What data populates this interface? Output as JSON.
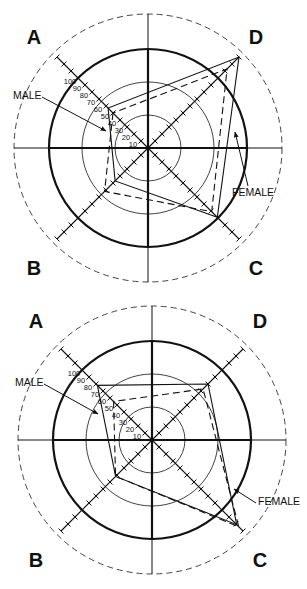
{
  "chart_data": [
    {
      "type": "radar",
      "title": "",
      "axes": [
        "A",
        "B",
        "C",
        "D"
      ],
      "scale": {
        "min": 0,
        "max": 130,
        "tick_step": 10,
        "tick_labels": [
          "10",
          "20",
          "30",
          "40",
          "50",
          "60",
          "70",
          "80",
          "90",
          "100"
        ],
        "reference_circle": 100
      },
      "series": [
        {
          "name": "MALE",
          "style": "solid",
          "values": {
            "A": 57,
            "B": 47,
            "C": 99,
            "D": 130
          }
        },
        {
          "name": "FEMALE",
          "style": "dashed",
          "values": {
            "A": 50,
            "B": 62,
            "C": 91,
            "D": 113
          }
        }
      ],
      "annotations": [
        "MALE",
        "FEMALE"
      ]
    },
    {
      "type": "radar",
      "title": "",
      "axes": [
        "A",
        "B",
        "C",
        "D"
      ],
      "scale": {
        "min": 0,
        "max": 130,
        "tick_step": 10,
        "tick_labels": [
          "10",
          "20",
          "30",
          "40",
          "50",
          "60",
          "70",
          "80",
          "90",
          "100"
        ],
        "reference_circle": 100
      },
      "series": [
        {
          "name": "MALE",
          "style": "solid",
          "values": {
            "A": 78,
            "B": 52,
            "C": 121,
            "D": 80
          }
        },
        {
          "name": "FEMALE",
          "style": "dashed",
          "values": {
            "A": 55,
            "B": 52,
            "C": 124,
            "D": 73
          }
        }
      ],
      "annotations": [
        "MALE",
        "FEMALE"
      ]
    }
  ],
  "panels": [
    {
      "quadrants": {
        "A": "A",
        "B": "B",
        "C": "C",
        "D": "D"
      },
      "labels": {
        "male": "MALE",
        "female": "FEMALE"
      }
    },
    {
      "quadrants": {
        "A": "A",
        "B": "B",
        "C": "C",
        "D": "D"
      },
      "labels": {
        "male": "MALE",
        "female": "FEMALE"
      }
    }
  ],
  "layout": [
    {
      "cx": 148,
      "cy": 148,
      "letters": {
        "A": [
          34,
          44
        ],
        "D": [
          256,
          44
        ],
        "B": [
          34,
          275
        ],
        "C": [
          256,
          275
        ]
      },
      "male_label": [
        13,
        99
      ],
      "male_arrow": [
        [
          42,
          97
        ],
        [
          106,
          131
        ]
      ],
      "female_label": [
        232,
        196
      ],
      "female_arrow": [
        [
          248,
          186
        ],
        [
          235,
          132
        ]
      ]
    },
    {
      "cx": 152,
      "cy": 440,
      "letters": {
        "A": [
          36,
          328
        ],
        "D": [
          260,
          328
        ],
        "B": [
          36,
          567
        ],
        "C": [
          260,
          567
        ]
      },
      "male_label": [
        15,
        386
      ],
      "male_arrow": [
        [
          44,
          384
        ],
        [
          98,
          414
        ]
      ],
      "female_label": [
        258,
        505
      ],
      "female_arrow": [
        [
          256,
          503
        ],
        [
          234,
          489
        ]
      ]
    }
  ],
  "colors": {
    "ink": "#111111",
    "background": "#ffffff"
  }
}
